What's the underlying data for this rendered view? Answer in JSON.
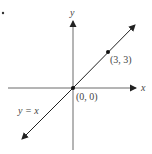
{
  "figure": {
    "axes": {
      "x_label": "x",
      "y_label": "y"
    },
    "line": {
      "equation_label": "y = x",
      "slope": 1,
      "intercept": 0
    },
    "points": [
      {
        "label": "(0, 0)",
        "x": 0,
        "y": 0
      },
      {
        "label": "(3, 3)",
        "x": 3,
        "y": 3
      }
    ],
    "marker": "•",
    "colors": {
      "axis": "#333333",
      "line": "#222222",
      "text": "#444444"
    }
  }
}
